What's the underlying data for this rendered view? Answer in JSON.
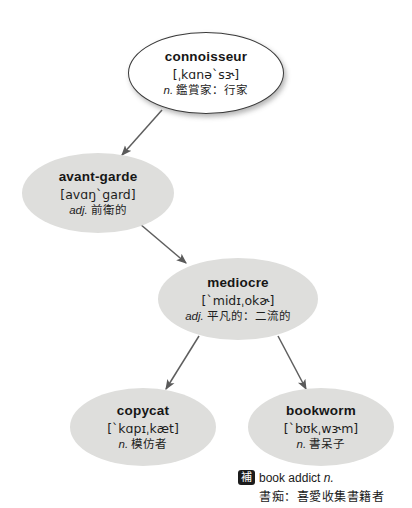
{
  "diagram": {
    "type": "flow-map",
    "nodes": [
      {
        "id": "connoisseur",
        "word": "connoisseur",
        "phonetic": "[ˌkɑnəˋsɝ]",
        "pos": "n.",
        "gloss_cn": "鑑賞家：行家",
        "style": "outlined"
      },
      {
        "id": "avant-garde",
        "word": "avant-garde",
        "phonetic": "[avɑŋˋgard]",
        "pos": "adj.",
        "gloss_cn": "前衛的",
        "style": "filled"
      },
      {
        "id": "mediocre",
        "word": "mediocre",
        "phonetic": "[ˋmidɪˌokɚ]",
        "pos": "adj.",
        "gloss_cn": "平凡的：二流的",
        "style": "filled"
      },
      {
        "id": "copycat",
        "word": "copycat",
        "phonetic": "[ˋkɑpɪˌkæt]",
        "pos": "n.",
        "gloss_cn": "模仿者",
        "style": "filled"
      },
      {
        "id": "bookworm",
        "word": "bookworm",
        "phonetic": "[ˋbʊkˌwɝm]",
        "pos": "n.",
        "gloss_cn": "書呆子",
        "style": "filled"
      }
    ],
    "edges": [
      {
        "from": "connoisseur",
        "to": "avant-garde"
      },
      {
        "from": "avant-garde",
        "to": "mediocre"
      },
      {
        "from": "mediocre",
        "to": "copycat"
      },
      {
        "from": "mediocre",
        "to": "bookworm"
      }
    ]
  },
  "footnote": {
    "badge": "補",
    "term": "book addict",
    "pos": "n.",
    "gloss_cn": "書痴：喜愛收集書籍者"
  },
  "colors": {
    "node_fill": "#dededc",
    "node_outline_stroke": "#3a3a3a",
    "arrow": "#5e5e5e",
    "text": "#1a1a1a",
    "badge_bg": "#1c1c1c",
    "page_bg": "#ffffff"
  }
}
